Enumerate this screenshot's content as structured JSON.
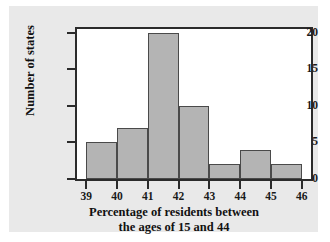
{
  "chart_data": {
    "type": "bar",
    "title": "",
    "subtitle": "",
    "xlabel_line1": "Percentage of residents between",
    "xlabel_line2": "the ages of 15 and 44",
    "ylabel": "Number of states",
    "bin_edges": [
      39,
      40,
      41,
      42,
      43,
      44,
      45,
      46
    ],
    "categories": [
      "39-40",
      "40-41",
      "41-42",
      "42-43",
      "43-44",
      "44-45",
      "45-46"
    ],
    "values": [
      5,
      7,
      20,
      10,
      2,
      4,
      2
    ],
    "xlim": [
      38.7,
      46.3
    ],
    "ylim": [
      0,
      20.5
    ],
    "xticks": [
      "39",
      "40",
      "41",
      "42",
      "43",
      "44",
      "45",
      "46"
    ],
    "xtick_values": [
      39,
      40,
      41,
      42,
      43,
      44,
      45,
      46
    ],
    "yticks": [
      "0",
      "5",
      "10",
      "15",
      "20"
    ],
    "ytick_values": [
      0,
      5,
      10,
      15,
      20
    ],
    "grid": false,
    "legend": false,
    "legend_position": "none",
    "bar_fill_color": "#b4b4b4",
    "bar_edge_color": "#4a4a4a",
    "axis_color": "#2b2b2b",
    "plot_background": "#ffffff",
    "figure_background": "#e9e9e9",
    "text_color": "#111111"
  }
}
